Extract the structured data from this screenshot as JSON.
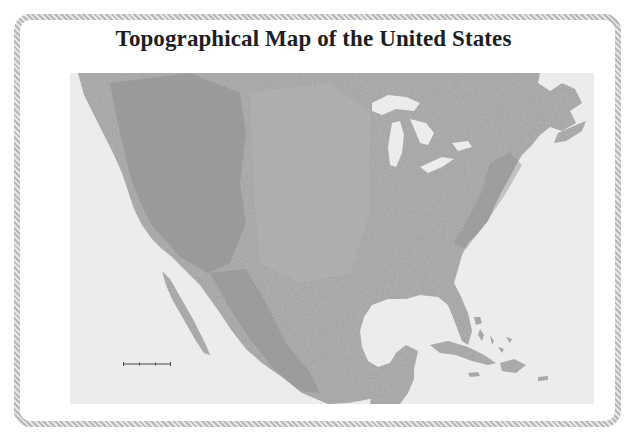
{
  "title": "Topographical Map of the United States",
  "map": {
    "type": "shaded-relief",
    "region": "North America (United States, Mexico, Caribbean, southern Canada)",
    "colors": {
      "land": "#a6a6a6",
      "land_highlands": "#8c8c8c",
      "water": "#ececec",
      "frame_border": "#b9b9b9"
    },
    "features": [
      "Great Lakes",
      "Gulf of Mexico",
      "Baja California",
      "Florida",
      "Cuba",
      "Hispaniola",
      "Bahamas",
      "Rocky Mountains",
      "Appalachian Mountains"
    ],
    "scale_bar": true
  }
}
